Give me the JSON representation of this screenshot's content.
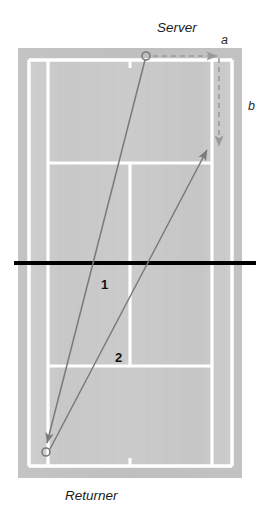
{
  "figure": {
    "type": "tennis-court-serve-diagram",
    "title_visible": false,
    "labels": {
      "server": "Server",
      "returner": "Returner",
      "lateral_a": "a",
      "depth_b": "b",
      "path_one": "1",
      "path_two": "2"
    },
    "colors": {
      "court_surface": "#c9c9c9",
      "court_surround": "#bfbfbf",
      "court_line": "#ffffff",
      "net_line": "#000000",
      "trajectory": "#7a7a7a",
      "dashed_guide": "#9a9a9a",
      "text": "#1a1a1a",
      "background": "#ffffff"
    },
    "markers": [
      {
        "name": "server-position",
        "x": 146,
        "y": 56,
        "shape": "open-circle"
      },
      {
        "name": "returner-position",
        "x": 46,
        "y": 452,
        "shape": "open-circle"
      }
    ],
    "paths": [
      {
        "name": "serve-trajectory",
        "label": "1",
        "from": "server-position",
        "to": "returner-position",
        "style": "solid-arrow",
        "label_x": 105,
        "label_y": 285
      },
      {
        "name": "return-trajectory",
        "label": "2",
        "from": "returner-position",
        "to_point": "deep-forehand-corner",
        "style": "solid-arrow",
        "label_x": 119,
        "label_y": 358
      },
      {
        "name": "lateral-displacement-guide",
        "label": "a",
        "style": "dashed-arrow",
        "orientation": "horizontal",
        "from_x": 152,
        "from_y": 56,
        "to_x": 220,
        "to_y": 56
      },
      {
        "name": "depth-displacement-guide",
        "label": "b",
        "style": "dashed-arrow",
        "orientation": "vertical",
        "from_x": 219,
        "from_y": 60,
        "to_x": 219,
        "to_y": 150
      }
    ],
    "court": {
      "surround": {
        "x": 18,
        "y": 48,
        "width": 224,
        "height": 430
      },
      "doubles": {
        "left": 29,
        "right": 232,
        "top": 60,
        "bottom": 466
      },
      "singles": {
        "left": 48,
        "right": 212
      },
      "service_line_top": 163,
      "service_line_bottom": 366,
      "center_service_line_x": 130,
      "net_y": 263,
      "center_mark_top_y": 60,
      "center_mark_bottom_y": 466
    }
  }
}
